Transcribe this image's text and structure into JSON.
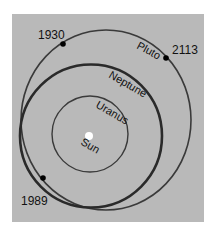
{
  "diagram": {
    "type": "orbital-diagram",
    "background_color": "#b9b9b9",
    "orbits": [
      {
        "name": "Pluto",
        "label": "Pluto"
      },
      {
        "name": "Neptune",
        "label": "Neptune"
      },
      {
        "name": "Uranus",
        "label": "Uranus"
      }
    ],
    "sun": {
      "label": "Sun"
    },
    "year_markers": [
      {
        "label": "1930"
      },
      {
        "label": "2113"
      },
      {
        "label": "1989"
      }
    ]
  }
}
